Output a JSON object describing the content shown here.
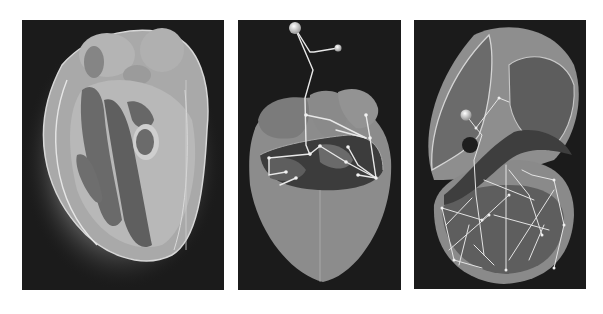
{
  "figure": {
    "background": "#ffffff",
    "panel_background": "#1b1b1b",
    "panels": [
      {
        "id": "volume-rendering",
        "description": "Semi-transparent volume rendering of a heart showing chambers",
        "box": {
          "x": 22,
          "y": 20,
          "w": 202,
          "h": 270
        }
      },
      {
        "id": "skeleton-overlay",
        "description": "Cut-away heart surface with white skeleton graph and two spherical nodes above",
        "box": {
          "x": 238,
          "y": 20,
          "w": 163,
          "h": 270
        }
      },
      {
        "id": "cutaway-network",
        "description": "Cross-sectioned heart with white line network inside ventricles and one spherical node",
        "box": {
          "x": 414,
          "y": 20,
          "w": 172,
          "h": 269
        }
      }
    ]
  }
}
